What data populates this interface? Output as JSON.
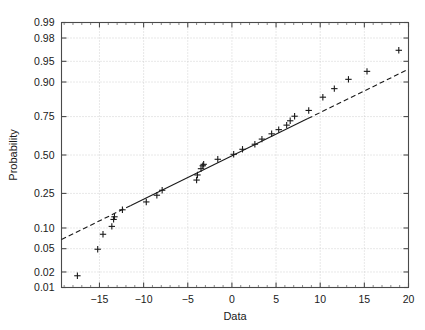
{
  "chart_data": {
    "type": "scatter",
    "title": "",
    "xlabel": "Data",
    "ylabel": "Probability",
    "xlim": [
      -19.3,
      20
    ],
    "ylim_prob": [
      0.01,
      0.99
    ],
    "yscale": "normal-probability",
    "grid": true,
    "legend": null,
    "xticks": [
      -15,
      -10,
      -5,
      0,
      5,
      10,
      15,
      20
    ],
    "xticklabels": [
      "-15",
      "-10",
      "-5",
      "0",
      "5",
      "10",
      "15",
      "20"
    ],
    "yticks": [
      0.01,
      0.02,
      0.05,
      0.1,
      0.25,
      0.5,
      0.75,
      0.9,
      0.95,
      0.98,
      0.99
    ],
    "yticklabels": [
      "0.01",
      "0.02",
      "0.05",
      "0.10",
      "0.25",
      "0.50",
      "0.75",
      "0.90",
      "0.95",
      "0.98",
      "0.99"
    ],
    "marker": "plus",
    "marker_color": "#1a1a1a",
    "reference_line": {
      "style_inner": "solid",
      "style_outer": "dashed",
      "color": "#1a1a1a",
      "x_start": -19.3,
      "x_end": 20.0,
      "solid_x_start": -11.5,
      "solid_x_end": 8.6,
      "p_start": 0.069,
      "p_end": 0.934
    },
    "points": [
      {
        "x": -17.5,
        "p": 0.017
      },
      {
        "x": -15.2,
        "p": 0.049
      },
      {
        "x": -14.6,
        "p": 0.082
      },
      {
        "x": -13.6,
        "p": 0.105
      },
      {
        "x": -13.4,
        "p": 0.129
      },
      {
        "x": -13.3,
        "p": 0.139
      },
      {
        "x": -12.4,
        "p": 0.168
      },
      {
        "x": -9.7,
        "p": 0.205
      },
      {
        "x": -8.5,
        "p": 0.24
      },
      {
        "x": -7.9,
        "p": 0.268
      },
      {
        "x": -4.0,
        "p": 0.33
      },
      {
        "x": -3.9,
        "p": 0.363
      },
      {
        "x": -3.5,
        "p": 0.405
      },
      {
        "x": -3.3,
        "p": 0.425
      },
      {
        "x": -3.2,
        "p": 0.435
      },
      {
        "x": -1.6,
        "p": 0.47
      },
      {
        "x": 0.2,
        "p": 0.505
      },
      {
        "x": 1.2,
        "p": 0.54
      },
      {
        "x": 2.6,
        "p": 0.575
      },
      {
        "x": 3.4,
        "p": 0.61
      },
      {
        "x": 4.5,
        "p": 0.645
      },
      {
        "x": 5.3,
        "p": 0.672
      },
      {
        "x": 6.2,
        "p": 0.7
      },
      {
        "x": 6.6,
        "p": 0.726
      },
      {
        "x": 7.1,
        "p": 0.752
      },
      {
        "x": 8.7,
        "p": 0.783
      },
      {
        "x": 10.3,
        "p": 0.845
      },
      {
        "x": 11.6,
        "p": 0.878
      },
      {
        "x": 13.2,
        "p": 0.908
      },
      {
        "x": 15.3,
        "p": 0.929
      },
      {
        "x": 18.9,
        "p": 0.967
      }
    ]
  },
  "axes": {
    "x_axis_label": "Data",
    "y_axis_label": "Probability"
  }
}
